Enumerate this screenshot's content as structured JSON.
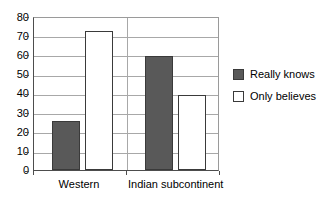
{
  "chart_data": {
    "type": "bar",
    "title": "",
    "subtitle": "",
    "xlabel": "",
    "ylabel": "",
    "categories": [
      "Western",
      "Indian subcontinent"
    ],
    "series": [
      {
        "name": "Really knows",
        "values": [
          26,
          61
        ],
        "color": "#595959"
      },
      {
        "name": "Only believes",
        "values": [
          74,
          40
        ],
        "color": "#ffffff"
      }
    ],
    "ylim": [
      0,
      80
    ],
    "ytick_step": 10,
    "yticks": [
      0,
      10,
      20,
      30,
      40,
      50,
      60,
      70,
      80
    ],
    "ytick_labels": [
      "0",
      "10",
      "20",
      "30",
      "40",
      "50",
      "60",
      "70",
      "80"
    ],
    "grid": "horizontal",
    "legend_position": "right",
    "legend": [
      {
        "label": "Really knows",
        "swatch": "dark"
      },
      {
        "label": "Only believes",
        "swatch": "light"
      }
    ]
  },
  "axes": {
    "y": {
      "ticks": [
        "80",
        "70",
        "60",
        "50",
        "40",
        "30",
        "20",
        "10",
        "0"
      ]
    },
    "x": {
      "labels": [
        "Western",
        "Indian subcontinent"
      ]
    }
  },
  "legend": {
    "items": [
      {
        "label": "Really knows"
      },
      {
        "label": "Only believes"
      }
    ]
  }
}
